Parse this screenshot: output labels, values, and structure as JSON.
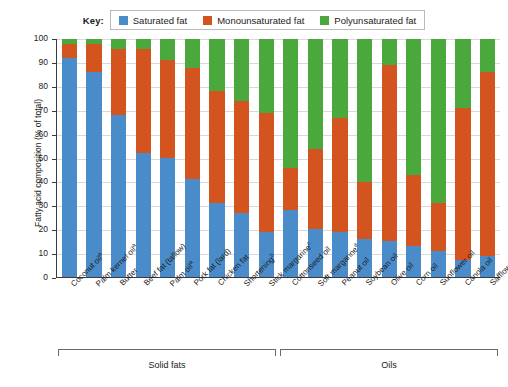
{
  "legend": {
    "title": "Key:",
    "items": [
      {
        "label": "Saturated fat",
        "color": "#4a8cc9",
        "icon": "legend-swatch-icon"
      },
      {
        "label": "Monounsaturated fat",
        "color": "#d4541f",
        "icon": "legend-swatch-icon"
      },
      {
        "label": "Polyunsaturated fat",
        "color": "#4aa83c",
        "icon": "legend-swatch-icon"
      }
    ]
  },
  "axes": {
    "ylabel": "Fatty acid composition (% of total)",
    "yticks": [
      "0",
      "10",
      "20",
      "30",
      "40",
      "50",
      "60",
      "70",
      "80",
      "90",
      "100"
    ]
  },
  "groups": [
    {
      "name": "Solid fats",
      "start": 0,
      "end": 8
    },
    {
      "name": "Oils",
      "start": 9,
      "end": 17
    }
  ],
  "chart_data": {
    "type": "bar",
    "title": "",
    "subtitle": "",
    "xlabel": "",
    "ylabel": "Fatty acid composition (% of total)",
    "ylim": [
      0,
      100
    ],
    "yticks": [
      0,
      10,
      20,
      30,
      40,
      50,
      60,
      70,
      80,
      90,
      100
    ],
    "grid": true,
    "stacked": true,
    "legend_position": "top-center",
    "legend": [
      "Saturated fat",
      "Monounsaturated fat",
      "Polyunsaturated fat"
    ],
    "categories": [
      "Coconut oilᵃ",
      "Palm kernel oilᵃ",
      "Butter",
      "Beef fat (tallow)",
      "Palm oilᵃ",
      "Pork fat (lard)",
      "Chicken fat",
      "Shorteningᵇ",
      "Stick margarineᶜ",
      "Cottonseed oil",
      "Soft margarineᵈ",
      "Peanut oil",
      "Soybean oil",
      "Olive oil",
      "Corn oil",
      "Sunflower oil",
      "Canola oil",
      "Safflower oil"
    ],
    "series": [
      {
        "name": "Saturated fat",
        "color": "#4a8cc9",
        "values": [
          92,
          86,
          68,
          52,
          50,
          41,
          31,
          27,
          19,
          28,
          20,
          19,
          16,
          15,
          13,
          11,
          7,
          9
        ]
      },
      {
        "name": "Monounsaturated fat",
        "color": "#d4541f",
        "values": [
          6,
          12,
          28,
          44,
          41,
          47,
          47,
          47,
          50,
          18,
          34,
          48,
          24,
          74,
          30,
          20,
          64,
          77
        ]
      },
      {
        "name": "Polyunsaturated fat",
        "color": "#4aa83c",
        "values": [
          2,
          2,
          4,
          4,
          9,
          12,
          22,
          26,
          31,
          54,
          46,
          33,
          60,
          11,
          57,
          69,
          29,
          14
        ]
      }
    ],
    "cumulative_tops": {
      "saturated": [
        92,
        86,
        68,
        52,
        50,
        41,
        31,
        27,
        19,
        28,
        20,
        19,
        16,
        15,
        13,
        11,
        7,
        9
      ],
      "plus_mono": [
        98,
        98,
        96,
        96,
        91,
        88,
        78,
        74,
        69,
        46,
        54,
        67,
        40,
        89,
        43,
        31,
        71,
        86
      ],
      "total": [
        100,
        100,
        100,
        100,
        100,
        100,
        100,
        100,
        100,
        100,
        100,
        100,
        100,
        100,
        100,
        100,
        100,
        100
      ]
    }
  }
}
